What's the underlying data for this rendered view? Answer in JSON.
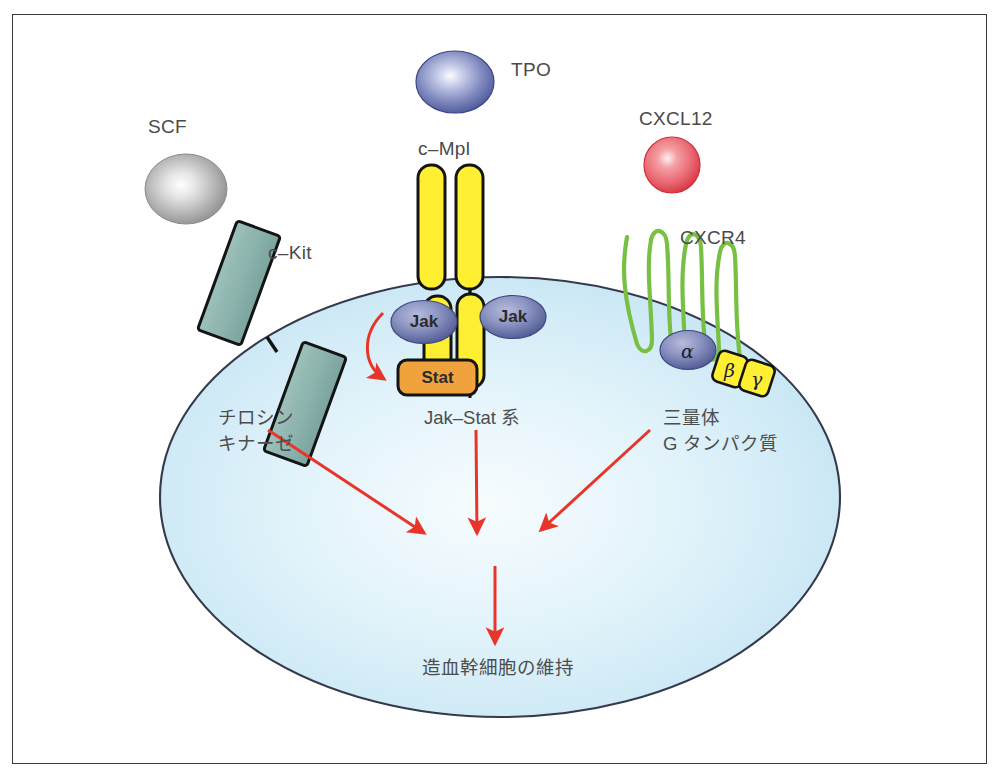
{
  "figure": {
    "type": "biological-signaling-diagram",
    "background_color": "#ffffff",
    "frame_color": "#3a3a3a"
  },
  "cell": {
    "name": "hematopoietic-stem-cell",
    "fill_edge": "#bfe2f2",
    "fill_center": "#f4fbfe",
    "outline": "#33384a"
  },
  "ligands": [
    {
      "id": "scf",
      "label": "SCF",
      "label_x": 148,
      "label_y": 127,
      "cx": 186,
      "cy": 189,
      "rx": 40,
      "ry": 34,
      "color_outer": "#8e8e8e",
      "color_inner": "#ffffff",
      "shape": "ellipse"
    },
    {
      "id": "tpo",
      "label": "TPO",
      "label_x": 511,
      "label_y": 69,
      "cx": 455,
      "cy": 82,
      "rx": 38,
      "ry": 30,
      "color_outer": "#4f5ba3",
      "color_inner": "#eef0fb",
      "shape": "ellipse"
    },
    {
      "id": "cxcl12",
      "label": "CXCL12",
      "label_x": 639,
      "label_y": 117,
      "cx": 672,
      "cy": 165,
      "rx": 28,
      "ry": 28,
      "color_outer": "#e0434f",
      "color_inner": "#fde7e8",
      "shape": "circle"
    }
  ],
  "receptors": [
    {
      "id": "c-kit",
      "label": "c–Kit",
      "label_x": 268,
      "label_y": 252,
      "color_fill": "#8fb5ae",
      "color_stroke": "#1a1a1a",
      "type": "tyrosine-kinase-receptor"
    },
    {
      "id": "c-mpl",
      "label": "c–Mpl",
      "label_x": 418,
      "label_y": 148,
      "color_fill": "#ffef33",
      "color_stroke": "#141414",
      "type": "cytokine-receptor"
    },
    {
      "id": "cxcr4",
      "label": "CXCR4",
      "label_x": 680,
      "label_y": 237,
      "color_stroke": "#77c043",
      "type": "seven-transmembrane-gpcr"
    }
  ],
  "signaling_nodes": [
    {
      "id": "jak-left",
      "label": "Jak",
      "cx": 424,
      "cy": 322,
      "rx": 32,
      "ry": 21,
      "fill_outer": "#515b96",
      "fill_inner": "#9aa2ce",
      "text_color": "#1d1d2e"
    },
    {
      "id": "jak-right",
      "label": "Jak",
      "cx": 512,
      "cy": 317,
      "rx": 32,
      "ry": 21,
      "fill_outer": "#515b96",
      "fill_inner": "#9aa2ce",
      "text_color": "#1d1d2e"
    },
    {
      "id": "stat",
      "label": "Stat",
      "x": 398,
      "y": 360,
      "w": 78,
      "h": 34,
      "fill": "#f0a33c",
      "stroke": "#141414",
      "text_color": "#1d1d1d"
    },
    {
      "id": "g-alpha",
      "label": "α",
      "cx": 688,
      "cy": 349,
      "rx": 27,
      "ry": 19,
      "fill_outer": "#515b96",
      "fill_inner": "#9aa2ce"
    },
    {
      "id": "g-beta",
      "label": "β",
      "cx": 729,
      "cy": 368,
      "fill": "#ffef33",
      "stroke": "#141414"
    },
    {
      "id": "g-gamma",
      "label": "γ",
      "cx": 751,
      "cy": 375,
      "fill": "#ffef33",
      "stroke": "#141414"
    }
  ],
  "pathway_labels": [
    {
      "id": "tyrosine-kinase",
      "lines": [
        "チロシン",
        "キナーゼ"
      ],
      "x": 218,
      "y": 407
    },
    {
      "id": "jak-stat-pathway",
      "lines": [
        "Jak–Stat 系"
      ],
      "x": 424,
      "y": 407
    },
    {
      "id": "trimeric-g-protein",
      "lines": [
        "三量体",
        "G タンパク質"
      ],
      "x": 663,
      "y": 407
    }
  ],
  "outcome": {
    "id": "hsc-maintenance",
    "label": "造血幹細胞の維持",
    "x": 498,
    "y": 668
  },
  "arrows": {
    "color": "#e8352a",
    "items": [
      {
        "id": "arrow-tyrosine-kinase",
        "from": [
          268,
          432
        ],
        "to": [
          427,
          535
        ]
      },
      {
        "id": "arrow-jak-stat",
        "from": [
          476,
          432
        ],
        "to": [
          478,
          535
        ]
      },
      {
        "id": "arrow-g-protein",
        "from": [
          648,
          432
        ],
        "to": [
          538,
          532
        ]
      },
      {
        "id": "arrow-to-outcome",
        "from": [
          495,
          566
        ],
        "to": [
          495,
          645
        ]
      },
      {
        "id": "arrow-jak-to-stat-curve",
        "from": [
          382,
          318
        ],
        "to": [
          392,
          382
        ]
      }
    ]
  }
}
